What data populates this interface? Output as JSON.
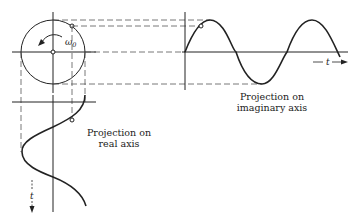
{
  "diagram": {
    "phasor": {
      "angular_velocity_label": "ω",
      "angular_velocity_subscript": "0"
    },
    "imaginary_projection": {
      "label_line1": "Projection on",
      "label_line2": "imaginary axis",
      "time_axis_label": "t"
    },
    "real_projection": {
      "label_line1": "Projection on",
      "label_line2": "real axis",
      "time_axis_label": "t"
    },
    "colors": {
      "ink": "#222222",
      "dashed": "#555555",
      "background": "#ffffff"
    }
  }
}
